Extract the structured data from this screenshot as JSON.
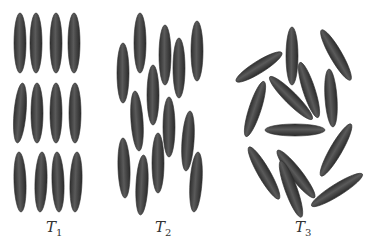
{
  "figure": {
    "colors": {
      "fill": "#4a4a4a",
      "highlight": "#7a7a7a",
      "edge": "#2e2e2e",
      "background": "#ffffff"
    },
    "panels": [
      {
        "id": "T1",
        "label": "T",
        "subscript": "1",
        "label_x": 46,
        "rods": [
          {
            "cx": 20,
            "cy": 43,
            "rx": 6,
            "ry": 30,
            "rot": 0
          },
          {
            "cx": 36,
            "cy": 43,
            "rx": 6,
            "ry": 30,
            "rot": 0
          },
          {
            "cx": 56,
            "cy": 43,
            "rx": 6,
            "ry": 30,
            "rot": 0
          },
          {
            "cx": 74,
            "cy": 43,
            "rx": 6,
            "ry": 30,
            "rot": 0
          },
          {
            "cx": 20,
            "cy": 113,
            "rx": 6,
            "ry": 30,
            "rot": 5
          },
          {
            "cx": 37,
            "cy": 113,
            "rx": 6,
            "ry": 30,
            "rot": 0
          },
          {
            "cx": 56,
            "cy": 113,
            "rx": 6,
            "ry": 30,
            "rot": 0
          },
          {
            "cx": 75,
            "cy": 113,
            "rx": 6,
            "ry": 30,
            "rot": 0
          },
          {
            "cx": 20,
            "cy": 182,
            "rx": 6,
            "ry": 30,
            "rot": -2
          },
          {
            "cx": 41,
            "cy": 182,
            "rx": 6,
            "ry": 30,
            "rot": 2
          },
          {
            "cx": 58,
            "cy": 182,
            "rx": 6,
            "ry": 30,
            "rot": -2
          },
          {
            "cx": 76,
            "cy": 182,
            "rx": 6,
            "ry": 30,
            "rot": 2
          }
        ]
      },
      {
        "id": "T2",
        "label": "T",
        "subscript": "2",
        "label_x": 155,
        "rods": [
          {
            "cx": 123,
            "cy": 73,
            "rx": 6,
            "ry": 30,
            "rot": 0
          },
          {
            "cx": 140,
            "cy": 43,
            "rx": 6,
            "ry": 30,
            "rot": 0
          },
          {
            "cx": 165,
            "cy": 55,
            "rx": 6,
            "ry": 30,
            "rot": 0
          },
          {
            "cx": 179,
            "cy": 68,
            "rx": 6,
            "ry": 30,
            "rot": 0
          },
          {
            "cx": 197,
            "cy": 51,
            "rx": 6,
            "ry": 30,
            "rot": 0
          },
          {
            "cx": 153,
            "cy": 95,
            "rx": 6,
            "ry": 30,
            "rot": 0
          },
          {
            "cx": 137,
            "cy": 121,
            "rx": 6,
            "ry": 30,
            "rot": -4
          },
          {
            "cx": 169,
            "cy": 127,
            "rx": 6,
            "ry": 30,
            "rot": 0
          },
          {
            "cx": 188,
            "cy": 141,
            "rx": 6,
            "ry": 30,
            "rot": 4
          },
          {
            "cx": 124,
            "cy": 168,
            "rx": 6,
            "ry": 30,
            "rot": -2
          },
          {
            "cx": 142,
            "cy": 185,
            "rx": 6,
            "ry": 30,
            "rot": 3
          },
          {
            "cx": 158,
            "cy": 163,
            "rx": 6,
            "ry": 30,
            "rot": 0
          },
          {
            "cx": 196,
            "cy": 182,
            "rx": 6,
            "ry": 30,
            "rot": 4
          }
        ]
      },
      {
        "id": "T3",
        "label": "T",
        "subscript": "3",
        "label_x": 295,
        "rods": [
          {
            "cx": 259,
            "cy": 67,
            "rx": 6,
            "ry": 27,
            "rot": 58
          },
          {
            "cx": 292,
            "cy": 56,
            "rx": 6,
            "ry": 29,
            "rot": 0
          },
          {
            "cx": 336,
            "cy": 55,
            "rx": 6,
            "ry": 29,
            "rot": -30
          },
          {
            "cx": 255,
            "cy": 109,
            "rx": 6,
            "ry": 29,
            "rot": 18
          },
          {
            "cx": 291,
            "cy": 98,
            "rx": 6,
            "ry": 30,
            "rot": -45
          },
          {
            "cx": 309,
            "cy": 90,
            "rx": 6,
            "ry": 29,
            "rot": -18
          },
          {
            "cx": 331,
            "cy": 98,
            "rx": 6,
            "ry": 29,
            "rot": -4
          },
          {
            "cx": 295,
            "cy": 130,
            "rx": 6,
            "ry": 30,
            "rot": 90
          },
          {
            "cx": 336,
            "cy": 150,
            "rx": 6,
            "ry": 30,
            "rot": 30
          },
          {
            "cx": 264,
            "cy": 173,
            "rx": 6,
            "ry": 30,
            "rot": -30
          },
          {
            "cx": 296,
            "cy": 174,
            "rx": 6,
            "ry": 30,
            "rot": -38
          },
          {
            "cx": 291,
            "cy": 189,
            "rx": 6,
            "ry": 30,
            "rot": -20
          },
          {
            "cx": 337,
            "cy": 190,
            "rx": 6,
            "ry": 30,
            "rot": 58
          }
        ]
      }
    ]
  }
}
